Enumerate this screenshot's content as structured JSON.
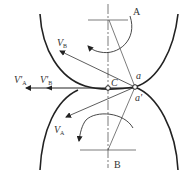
{
  "diagram": {
    "type": "gear-tooth-velocity",
    "labels": {
      "A": "A",
      "B": "B",
      "C": "C",
      "a": "a",
      "a_prime": "a'",
      "VB": {
        "main": "V",
        "sub": "B"
      },
      "VA": {
        "main": "V",
        "sub": "A"
      },
      "VA_prime": {
        "main": "V'",
        "sub": "A"
      },
      "VB_prime": {
        "main": "V'",
        "sub": "B"
      }
    },
    "colors": {
      "stroke": "#222222",
      "thin": "#444444",
      "text": "#333333"
    }
  }
}
